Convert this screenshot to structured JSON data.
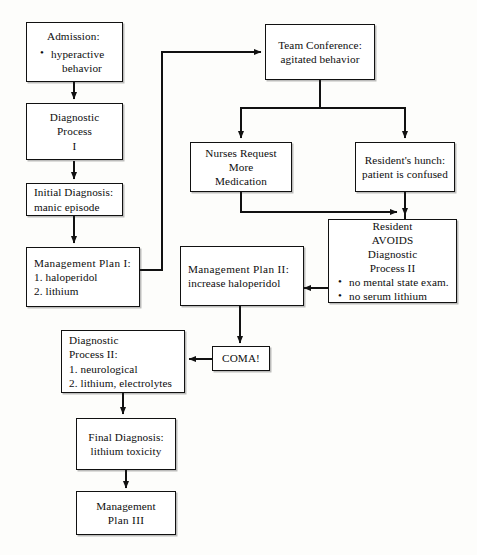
{
  "diagram": {
    "type": "flowchart",
    "line_color": "#111111",
    "box_fill": "#ffffff",
    "nodes": [
      {
        "id": "admission",
        "lines": [
          "Admission:"
        ],
        "bullets": [
          "hyperactive",
          "behavior"
        ]
      },
      {
        "id": "diagnostic_process_i",
        "l1": "Diagnostic",
        "l2": "Process",
        "l3": "I"
      },
      {
        "id": "initial_diagnosis",
        "l1": "Initial Diagnosis:",
        "l2": "manic episode"
      },
      {
        "id": "management_plan_i",
        "l1": "Management Plan I:",
        "l2": "1. haloperidol",
        "l3": "2. lithium"
      },
      {
        "id": "team_conference",
        "l1": "Team Conference:",
        "l2": "agitated behavior"
      },
      {
        "id": "nurses_request",
        "l1": "Nurses Request",
        "l2": "More",
        "l3": "Medication"
      },
      {
        "id": "residents_hunch",
        "l1": "Resident's hunch:",
        "l2": "patient is confused"
      },
      {
        "id": "resident_avoids",
        "l1": "Resident",
        "l2": "AVOIDS",
        "l3": "Diagnostic",
        "l4": "Process II",
        "b1": "no mental state exam.",
        "b2": "no serum lithium"
      },
      {
        "id": "management_plan_ii",
        "l1": "Management Plan II:",
        "l2": "increase haloperidol"
      },
      {
        "id": "coma",
        "l1": "COMA!"
      },
      {
        "id": "diagnostic_process_ii",
        "l1": "Diagnostic",
        "l2": "Process II:",
        "l3": "1. neurological",
        "l4": "2. lithium, electrolytes"
      },
      {
        "id": "final_diagnosis",
        "l1": "Final Diagnosis:",
        "l2": "lithium toxicity"
      },
      {
        "id": "management_plan_iii",
        "l1": "Management",
        "l2": "Plan III"
      }
    ],
    "edges": [
      {
        "from": "admission",
        "to": "diagnostic_process_i"
      },
      {
        "from": "diagnostic_process_i",
        "to": "initial_diagnosis"
      },
      {
        "from": "initial_diagnosis",
        "to": "management_plan_i"
      },
      {
        "from": "management_plan_i",
        "to": "team_conference"
      },
      {
        "from": "team_conference",
        "to": "nurses_request"
      },
      {
        "from": "team_conference",
        "to": "residents_hunch"
      },
      {
        "from": "nurses_request",
        "to": "resident_avoids"
      },
      {
        "from": "residents_hunch",
        "to": "resident_avoids"
      },
      {
        "from": "resident_avoids",
        "to": "management_plan_ii"
      },
      {
        "from": "management_plan_ii",
        "to": "coma"
      },
      {
        "from": "coma",
        "to": "diagnostic_process_ii"
      },
      {
        "from": "diagnostic_process_ii",
        "to": "final_diagnosis"
      },
      {
        "from": "final_diagnosis",
        "to": "management_plan_iii"
      }
    ]
  }
}
